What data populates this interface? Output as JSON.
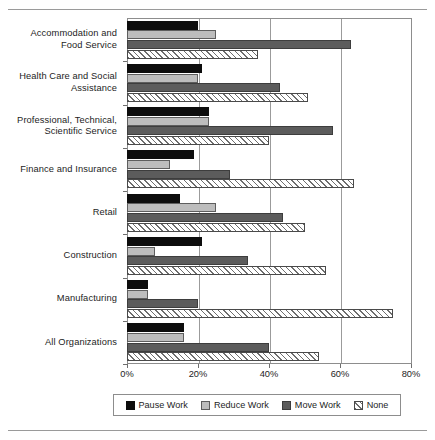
{
  "chart_data": {
    "type": "bar",
    "orientation": "horizontal",
    "title": "",
    "subtitle": "",
    "xlabel": "",
    "ylabel": "",
    "xlim": [
      0,
      80
    ],
    "xtick_labels": [
      "0%",
      "20%",
      "40%",
      "60%",
      "80%"
    ],
    "xtick_values": [
      0,
      20,
      40,
      60,
      80
    ],
    "grid": "vertical",
    "legend_position": "bottom",
    "categories": [
      "Accommodation and\nFood Service",
      "Health Care and Social\nAssistance",
      "Professional, Technical,\nScientific Service",
      "Finance and Insurance",
      "Retail",
      "Construction",
      "Manufacturing",
      "All Organizations"
    ],
    "series": [
      {
        "name": "Pause Work",
        "color": "#0d0d0d",
        "pattern": "solid",
        "values": [
          20,
          21,
          23,
          19,
          15,
          21,
          6,
          16
        ]
      },
      {
        "name": "Reduce Work",
        "color": "#bdbdbd",
        "pattern": "solid",
        "values": [
          25,
          20,
          23,
          12,
          25,
          8,
          6,
          16
        ]
      },
      {
        "name": "Move Work",
        "color": "#5c5c5c",
        "pattern": "solid",
        "values": [
          63,
          43,
          58,
          29,
          44,
          34,
          20,
          40
        ]
      },
      {
        "name": "None",
        "color": "#ffffff",
        "pattern": "hatch",
        "values": [
          37,
          51,
          40,
          64,
          50,
          56,
          75,
          54
        ]
      }
    ]
  },
  "legend": {
    "items": [
      {
        "label": "Pause Work"
      },
      {
        "label": "Reduce Work"
      },
      {
        "label": "Move Work"
      },
      {
        "label": "None"
      }
    ]
  }
}
